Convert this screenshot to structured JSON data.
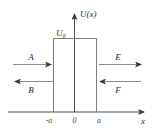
{
  "figure": {
    "axes": {
      "y_label": "U(x)",
      "x_label": "x"
    },
    "barrier": {
      "height_label": "U",
      "height_subscript": "0",
      "left_edge_label": "-a",
      "origin_label": "0",
      "right_edge_label": "a"
    },
    "waves": [
      {
        "name": "incident",
        "label": "A",
        "direction": "right",
        "side": "left"
      },
      {
        "name": "reflected",
        "label": "B",
        "direction": "left",
        "side": "left"
      },
      {
        "name": "transmitted",
        "label": "E",
        "direction": "right",
        "side": "right"
      },
      {
        "name": "return",
        "label": "F",
        "direction": "left",
        "side": "right"
      }
    ],
    "colors": {
      "line": "#5a5a5a",
      "axis": "#3a3a3a",
      "text": "#2b2b2b",
      "background": "#ffffff"
    }
  }
}
